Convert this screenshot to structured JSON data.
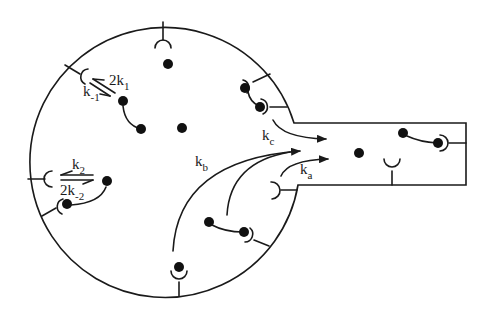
{
  "diagram": {
    "colors": {
      "line": "#1a1a1a",
      "dot": "#111111",
      "background": "#ffffff"
    },
    "labels": {
      "k1_forward": {
        "main": "2k",
        "sub": "1"
      },
      "k1_reverse": {
        "main": "k",
        "sub": "-1"
      },
      "k2_forward": {
        "main": "k",
        "sub": "2"
      },
      "k2_reverse": {
        "main": "2k",
        "sub": "-2"
      },
      "ka": {
        "main": "k",
        "sub": "a"
      },
      "kb": {
        "main": "k",
        "sub": "b"
      },
      "kc": {
        "main": "k",
        "sub": "c"
      }
    }
  }
}
